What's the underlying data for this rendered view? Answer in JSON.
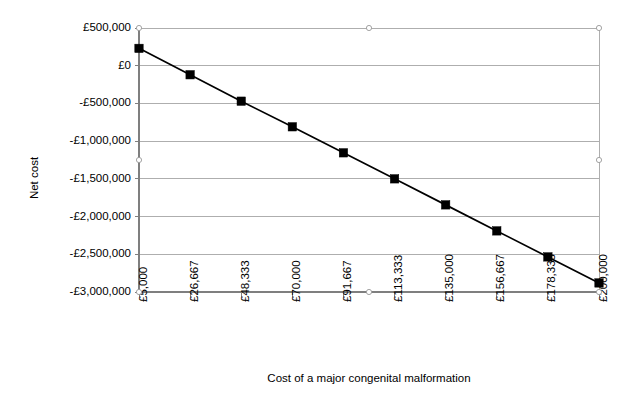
{
  "chart_data": {
    "type": "line",
    "title": "",
    "subtitle": "",
    "xlabel": "Cost of a major congenital  malformation",
    "ylabel": "Net cost",
    "categories": [
      "£5,000",
      "£26,667",
      "£48,333",
      "£70,000",
      "£91,667",
      "£113,333",
      "£135,000",
      "£156,667",
      "£178,333",
      "£200,000"
    ],
    "x": [
      5000,
      26667,
      48333,
      70000,
      91667,
      113333,
      135000,
      156667,
      178333,
      200000
    ],
    "values": [
      230000,
      -120000,
      -470000,
      -810000,
      -1155000,
      -1500000,
      -1845000,
      -2190000,
      -2535000,
      -2880000
    ],
    "series": [
      {
        "name": "Net cost",
        "values": [
          230000,
          -120000,
          -470000,
          -810000,
          -1155000,
          -1500000,
          -1845000,
          -2190000,
          -2535000,
          -2880000
        ],
        "color": "#000000",
        "marker": "square"
      }
    ],
    "ylim": [
      -3000000,
      500000
    ],
    "ytick_values": [
      500000,
      0,
      -500000,
      -1000000,
      -1500000,
      -2000000,
      -2500000,
      -3000000
    ],
    "ytick_labels": [
      "£500,000",
      "£0",
      "-£500,000",
      "-£1,000,000",
      "-£1,500,000",
      "-£2,000,000",
      "-£2,500,000",
      "-£3,000,000"
    ],
    "grid": true,
    "grid_axis": "y",
    "legend": false,
    "legend_position": "none",
    "colors": {
      "background": "#ffffff",
      "plot_area": "#ffffff",
      "gridline": "#9a9a9a",
      "axis": "#7f7f7f",
      "series": "#000000",
      "text": "#000000"
    }
  }
}
